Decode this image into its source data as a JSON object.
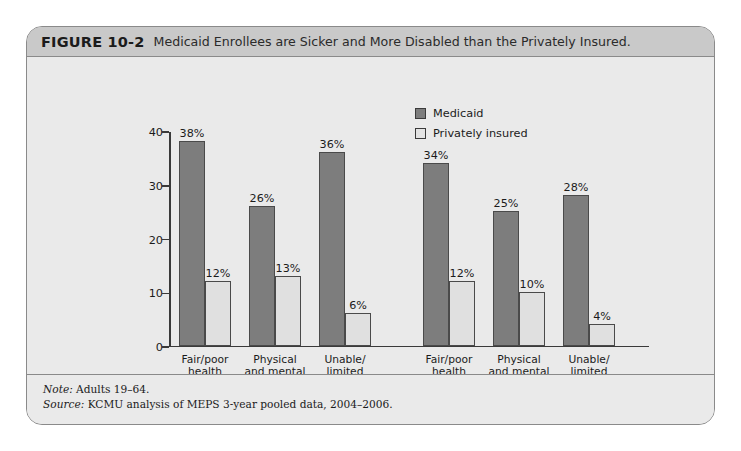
{
  "figure": {
    "number": "FIGURE 10-2",
    "title": "Medicaid Enrollees are Sicker and More Disabled than the Privately Insured."
  },
  "legend": {
    "position": "top-right",
    "items": [
      {
        "label": "Medicaid",
        "color": "#7d7d7d"
      },
      {
        "label": "Privately insured",
        "color": "#e3e3e3"
      }
    ]
  },
  "groups": [
    {
      "name": "Poor",
      "sub": "(<100% FPL)"
    },
    {
      "name": "Near poor",
      "sub": "(100–199% FPL)"
    }
  ],
  "categories": [
    "Fair/poor\nhealth",
    "Physical\nand mental\nchronic\ncondition",
    "Unable/\nlimited\nwork due\nto health"
  ],
  "axis": {
    "y_ticks": [
      "0",
      "10",
      "20",
      "30",
      "40"
    ],
    "y_min": 0,
    "y_max": 40
  },
  "value_labels": {
    "poor": {
      "medicaid": [
        "38%",
        "26%",
        "36%"
      ],
      "private": [
        "12%",
        "13%",
        "6%"
      ]
    },
    "near_poor": {
      "medicaid": [
        "34%",
        "25%",
        "28%"
      ],
      "private": [
        "12%",
        "10%",
        "4%"
      ]
    }
  },
  "footer": {
    "note_lead": "Note:",
    "note_text": " Adults 19–64.",
    "source_lead": "Source:",
    "source_text": " KCMU analysis of MEPS 3-year pooled data, 2004–2006."
  },
  "chart_data": {
    "type": "bar",
    "title": "Medicaid Enrollees are Sicker and More Disabled than the Privately Insured.",
    "xlabel": "",
    "ylabel": "",
    "ylim": [
      0,
      40
    ],
    "yticks": [
      0,
      10,
      20,
      30,
      40
    ],
    "grid": false,
    "legend_position": "top-right",
    "groups": [
      "Poor (<100% FPL)",
      "Near poor (100–199% FPL)"
    ],
    "categories": [
      "Fair/poor health",
      "Physical and mental chronic condition",
      "Unable/limited work due to health"
    ],
    "series": [
      {
        "name": "Medicaid",
        "color": "#7d7d7d",
        "values_by_group": {
          "Poor (<100% FPL)": [
            38,
            26,
            36
          ],
          "Near poor (100–199% FPL)": [
            34,
            25,
            28
          ]
        }
      },
      {
        "name": "Privately insured",
        "color": "#e3e3e3",
        "values_by_group": {
          "Poor (<100% FPL)": [
            12,
            13,
            6
          ],
          "Near poor (100–199% FPL)": [
            12,
            10,
            4
          ]
        }
      }
    ],
    "units": "percent",
    "annotations": [
      "Note: Adults 19–64.",
      "Source: KCMU analysis of MEPS 3-year pooled data, 2004–2006."
    ]
  }
}
